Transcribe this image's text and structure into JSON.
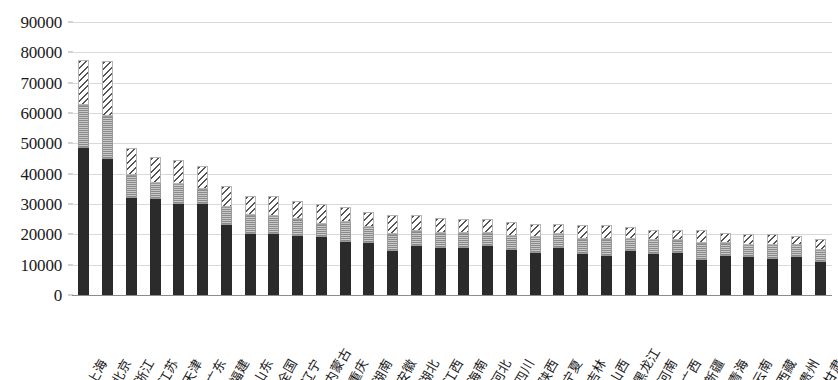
{
  "chart_data": {
    "type": "bar",
    "subtype": "stacked-bar",
    "title": "",
    "subtitle": "",
    "xlabel": "",
    "ylabel": "",
    "ylim": [
      0,
      90000
    ],
    "ytick_step": 10000,
    "ytick_labels": [
      "0",
      "10000",
      "20000",
      "30000",
      "40000",
      "50000",
      "60000",
      "70000",
      "80000",
      "90000"
    ],
    "ytick_values": [
      0,
      10000,
      20000,
      30000,
      40000,
      50000,
      60000,
      70000,
      80000,
      90000
    ],
    "grid": true,
    "grid_axis": "y",
    "legend": false,
    "legend_position": "none",
    "categories": [
      "上海",
      "北京",
      "浙江",
      "江苏",
      "天津",
      "广东",
      "福建",
      "山东",
      "全国",
      "辽宁",
      "内蒙古",
      "重庆",
      "湖南",
      "安徽",
      "湖北",
      "江西",
      "海南",
      "河北",
      "四川",
      "陕西",
      "宁夏",
      "吉林",
      "山西",
      "黑龙江",
      "河南",
      "广西",
      "新疆",
      "青海",
      "云南",
      "西藏",
      "贵州",
      "甘肃"
    ],
    "series": [
      {
        "name": "series-1-solid-dark",
        "pattern": "solid",
        "color": "#2b2b2b",
        "values": [
          48500,
          45000,
          32000,
          31500,
          30000,
          30000,
          23000,
          20000,
          20000,
          19500,
          19000,
          17500,
          17000,
          14500,
          16000,
          15500,
          15500,
          16000,
          15000,
          14000,
          15500,
          13500,
          13000,
          14500,
          13500,
          14000,
          11500,
          13000,
          12500,
          12000,
          12500,
          11000
        ]
      },
      {
        "name": "series-2-dotted-gray",
        "pattern": "dotted",
        "color": "#a8a8a8",
        "values": [
          14000,
          14000,
          7500,
          5500,
          6500,
          5000,
          6000,
          6500,
          6000,
          5500,
          4500,
          6500,
          5500,
          5500,
          5000,
          5000,
          5000,
          4500,
          4500,
          5000,
          4500,
          5000,
          5500,
          4000,
          4500,
          4000,
          5500,
          4000,
          4000,
          4500,
          4000,
          4000
        ]
      },
      {
        "name": "series-3-hatched",
        "pattern": "diagonal-hatch",
        "color": "#555555",
        "values": [
          15000,
          18000,
          9000,
          8500,
          8000,
          7500,
          7000,
          6000,
          6500,
          6000,
          6500,
          5000,
          5000,
          6500,
          5500,
          5000,
          4500,
          4500,
          4500,
          4500,
          3500,
          4500,
          4500,
          4000,
          3500,
          3500,
          4500,
          3500,
          3500,
          3500,
          3000,
          3500
        ]
      }
    ],
    "totals": [
      77500,
      77000,
      48500,
      45500,
      44500,
      42500,
      36000,
      32500,
      32500,
      31000,
      30000,
      29000,
      27500,
      26500,
      26500,
      25500,
      25000,
      25000,
      24000,
      23500,
      23500,
      23000,
      23000,
      22500,
      21500,
      21500,
      21500,
      20500,
      20000,
      20000,
      19500,
      18500
    ]
  },
  "colors": {
    "series_1": "#2b2b2b",
    "series_2": "#a8a8a8",
    "series_3": "#555555",
    "gridline": "#d9d9d9",
    "axis": "#8c8c8c",
    "background": "#ffffff",
    "text": "#1a1a1a"
  }
}
